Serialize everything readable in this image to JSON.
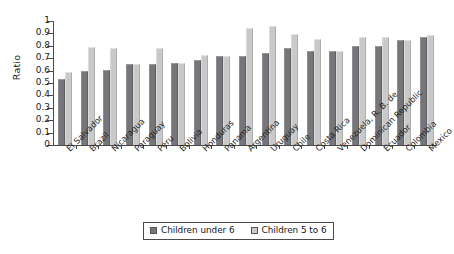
{
  "chart_data": {
    "type": "bar",
    "title": "",
    "xlabel": "",
    "ylabel": "Ratio",
    "ylim": [
      0,
      1
    ],
    "ytick_labels": [
      "1",
      "0.9",
      "0.8",
      "0.7",
      "0.6",
      "0.5",
      "0.4",
      "0.3",
      "0.2",
      "0.1",
      "0"
    ],
    "ytick_values": [
      1,
      0.9,
      0.8,
      0.7,
      0.6,
      0.5,
      0.4,
      0.3,
      0.2,
      0.1,
      0
    ],
    "grid": false,
    "legend_position": "bottom",
    "categories": [
      "El Salvador",
      "Brazil",
      "Nicaragua",
      "Paraguay",
      "Peru",
      "Bolivia",
      "Honduras",
      "Panama",
      "Argentina",
      "Uruguay",
      "Chile",
      "Costa Rica",
      "Venezuela, R. B. de",
      "Dominican Republic",
      "Ecuador",
      "Colombia",
      "Mexico"
    ],
    "series": [
      {
        "name": "Children under 6",
        "color": "#76767a",
        "values": [
          0.535,
          0.595,
          0.605,
          0.655,
          0.655,
          0.665,
          0.685,
          0.715,
          0.72,
          0.74,
          0.78,
          0.76,
          0.755,
          0.795,
          0.795,
          0.845,
          0.87
        ]
      },
      {
        "name": "Children 5 to 6",
        "color": "#c9c9c9",
        "values": [
          0.585,
          0.79,
          0.78,
          0.655,
          0.78,
          0.665,
          0.725,
          0.715,
          0.94,
          0.96,
          0.895,
          0.855,
          0.755,
          0.875,
          0.87,
          0.845,
          0.885
        ]
      }
    ]
  },
  "legend": {
    "items": [
      {
        "label": "Children under 6",
        "swatch": "dark-gray-swatch"
      },
      {
        "label": "Children 5 to 6",
        "swatch": "light-gray-swatch"
      }
    ]
  }
}
